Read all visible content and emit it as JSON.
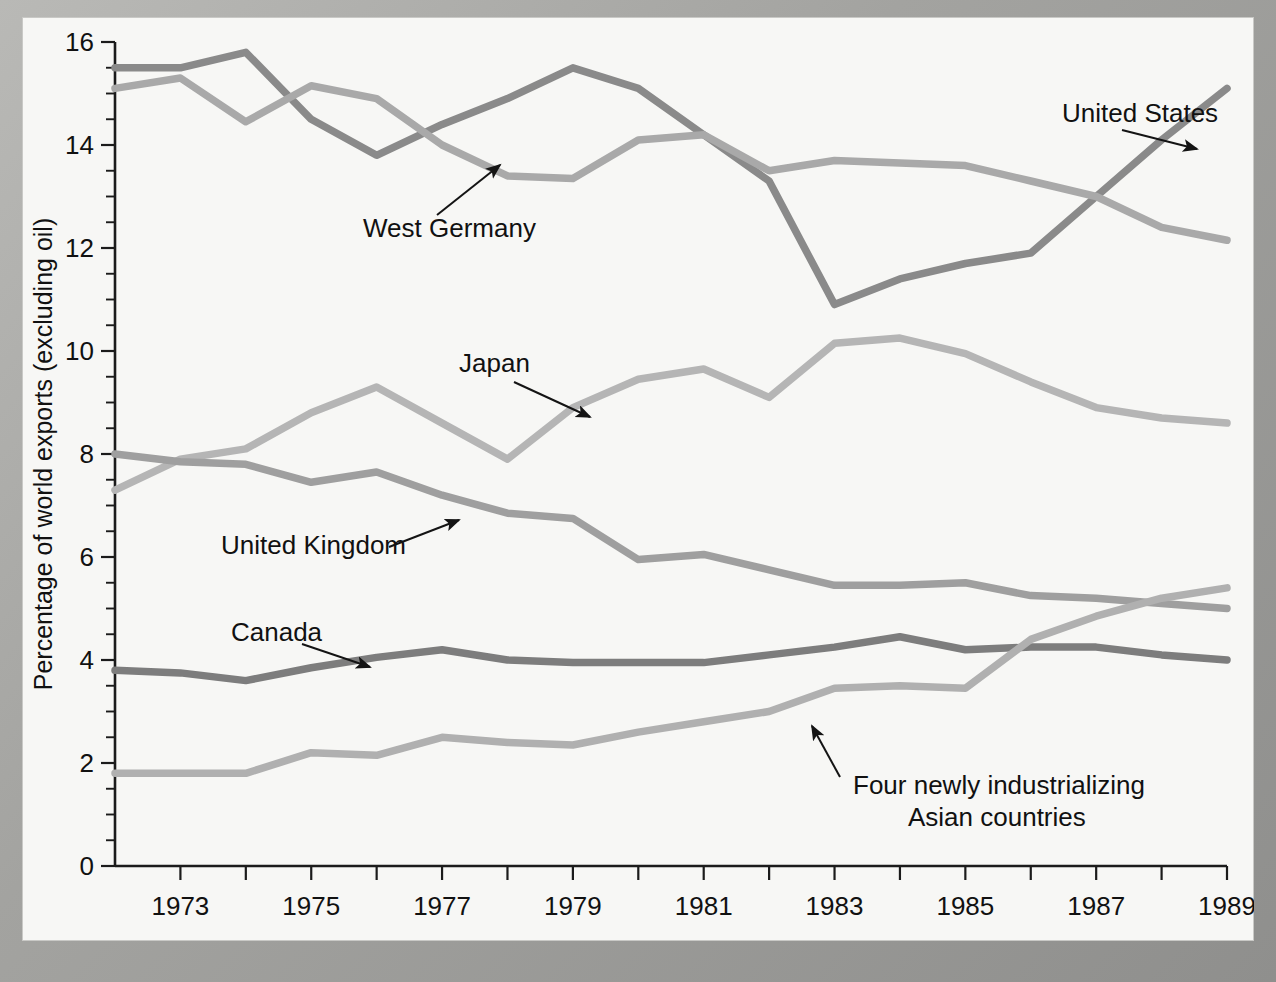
{
  "figure": {
    "background_color": "#f7f7f5",
    "border_color": "#a3a3a0"
  },
  "chart_data": {
    "type": "line",
    "title": "",
    "xlabel": "Year",
    "ylabel": "Percentage of world exports (excluding oil)",
    "xlim": [
      1972,
      1989
    ],
    "ylim": [
      0,
      16
    ],
    "ytick_major_step": 2,
    "ytick_minor_step": 0.5,
    "xtick_step": 1,
    "grid": false,
    "legend_position": "inline-annotations",
    "x": [
      1972,
      1973,
      1974,
      1975,
      1976,
      1977,
      1978,
      1979,
      1980,
      1981,
      1982,
      1983,
      1984,
      1985,
      1986,
      1987,
      1988,
      1989
    ],
    "ytick_labels": [
      "0",
      "2",
      "4",
      "6",
      "8",
      "10",
      "12",
      "14",
      "16"
    ],
    "xtick_labels": [
      "1973",
      "1975",
      "1977",
      "1979",
      "1981",
      "1983",
      "1985",
      "1987",
      "1989"
    ],
    "series": [
      {
        "name": "United States",
        "color": "#8a8a8a",
        "label": "United States",
        "values": [
          15.5,
          15.5,
          15.8,
          14.5,
          13.8,
          14.4,
          14.9,
          15.5,
          15.1,
          14.2,
          13.3,
          10.9,
          11.4,
          11.7,
          11.9,
          13.0,
          14.1,
          15.1
        ]
      },
      {
        "name": "West Germany",
        "color": "#a9a9a9",
        "label": "West Germany",
        "values": [
          15.1,
          15.3,
          14.45,
          15.15,
          14.9,
          14.0,
          13.4,
          13.35,
          14.1,
          14.2,
          13.5,
          13.7,
          13.65,
          13.6,
          13.3,
          13.0,
          12.4,
          12.15
        ]
      },
      {
        "name": "Japan",
        "color": "#b5b5b5",
        "label": "Japan",
        "values": [
          7.3,
          7.9,
          8.1,
          8.8,
          9.3,
          8.6,
          7.9,
          8.9,
          9.45,
          9.65,
          9.1,
          10.15,
          10.25,
          9.95,
          9.4,
          8.9,
          8.7,
          8.6
        ]
      },
      {
        "name": "United Kingdom",
        "color": "#9f9f9f",
        "label": "United Kingdom",
        "values": [
          8.0,
          7.85,
          7.8,
          7.45,
          7.65,
          7.2,
          6.85,
          6.75,
          5.95,
          6.05,
          5.75,
          5.45,
          5.45,
          5.5,
          5.25,
          5.2,
          5.1,
          5.0
        ]
      },
      {
        "name": "Canada",
        "color": "#7d7d7d",
        "label": "Canada",
        "values": [
          3.8,
          3.75,
          3.6,
          3.85,
          4.05,
          4.2,
          4.0,
          3.95,
          3.95,
          3.95,
          4.1,
          4.25,
          4.45,
          4.2,
          4.25,
          4.25,
          4.1,
          4.0
        ]
      },
      {
        "name": "Four newly industrializing Asian countries",
        "color": "#b0b0b0",
        "label": "Four newly industrializing\nAsian countries",
        "values": [
          1.8,
          1.8,
          1.8,
          2.2,
          2.15,
          2.5,
          2.4,
          2.35,
          2.6,
          2.8,
          3.0,
          3.45,
          3.5,
          3.45,
          4.4,
          4.85,
          5.2,
          5.4
        ]
      }
    ],
    "annotations": [
      {
        "name": "united-states",
        "text": "United States",
        "x": 1040,
        "y": 105,
        "arrow": [
          [
            1100,
            113
          ],
          [
            1175,
            132
          ]
        ]
      },
      {
        "name": "west-germany",
        "text": "West Germany",
        "x": 341,
        "y": 220,
        "arrow": [
          [
            415,
            198
          ],
          [
            478,
            148
          ]
        ]
      },
      {
        "name": "japan",
        "text": "Japan",
        "x": 437,
        "y": 355,
        "arrow": [
          [
            492,
            365
          ],
          [
            568,
            400
          ]
        ]
      },
      {
        "name": "united-kingdom",
        "text": "United Kingdom",
        "x": 199,
        "y": 537,
        "arrow": [
          [
            367,
            530
          ],
          [
            437,
            503
          ]
        ]
      },
      {
        "name": "canada",
        "text": "Canada",
        "x": 209,
        "y": 624,
        "arrow": [
          [
            280,
            627
          ],
          [
            348,
            650
          ]
        ]
      },
      {
        "name": "four-nics-line1",
        "text": "Four newly industrializing",
        "x": 831,
        "y": 777,
        "arrow": [
          [
            818,
            760
          ],
          [
            790,
            709
          ]
        ]
      },
      {
        "name": "four-nics-line2",
        "text": "Asian countries",
        "x": 886,
        "y": 809,
        "arrow": null
      }
    ]
  }
}
